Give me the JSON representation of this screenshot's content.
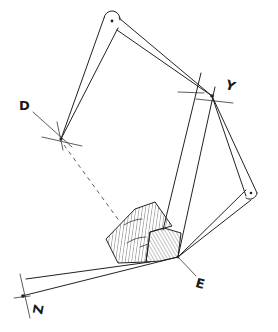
{
  "figure": {
    "type": "mechanical linkage sketch",
    "colors": {
      "ink": "#222222",
      "background": "#ffffff"
    },
    "labels": {
      "D": "D",
      "Y": "Y",
      "E": "E",
      "Z": "Z"
    },
    "points": {
      "top_pivot": [
        112,
        21
      ],
      "D": [
        61,
        139
      ],
      "Y": [
        212,
        96
      ],
      "right_pivot": [
        251,
        193
      ],
      "E": [
        178,
        257
      ],
      "Z": [
        22,
        296
      ]
    }
  }
}
